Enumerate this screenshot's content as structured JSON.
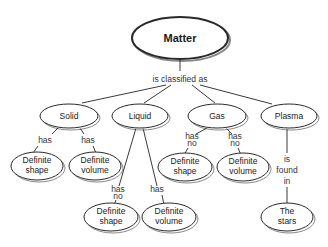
{
  "diagram": {
    "root": {
      "label": "Matter"
    },
    "root_link": "is classified as",
    "categories": [
      {
        "label": "Solid",
        "children": [
          {
            "link": [
              "has"
            ],
            "label": [
              "Definite",
              "shape"
            ]
          },
          {
            "link": [
              "has"
            ],
            "label": [
              "Definite",
              "volume"
            ]
          }
        ]
      },
      {
        "label": "Liquid",
        "children": [
          {
            "link": [
              "has",
              "no"
            ],
            "label": [
              "Definite",
              "shape"
            ]
          },
          {
            "link": [
              "has"
            ],
            "label": [
              "Definite",
              "volume"
            ]
          }
        ]
      },
      {
        "label": "Gas",
        "children": [
          {
            "link": [
              "has",
              "no"
            ],
            "label": [
              "Definite",
              "shape"
            ]
          },
          {
            "link": [
              "has",
              "no"
            ],
            "label": [
              "Definite",
              "volume"
            ]
          }
        ]
      },
      {
        "label": "Plasma",
        "children": [
          {
            "link": [
              "is",
              "found",
              "in"
            ],
            "label": [
              "The",
              "stars"
            ]
          }
        ]
      }
    ]
  }
}
